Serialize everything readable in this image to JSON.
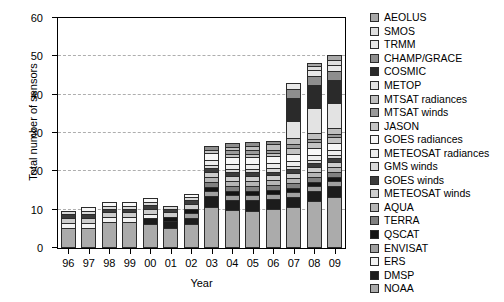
{
  "chart_data": {
    "type": "bar",
    "stacked": true,
    "title": "",
    "xlabel": "Year",
    "ylabel": "Total number of sensors",
    "ylim": [
      0,
      60
    ],
    "yticks": [
      0,
      10,
      20,
      30,
      40,
      50,
      60
    ],
    "grid": true,
    "legend_position": "right",
    "categories": [
      "96",
      "97",
      "98",
      "99",
      "00",
      "01",
      "02",
      "03",
      "04",
      "05",
      "06",
      "07",
      "08",
      "09"
    ],
    "totals": [
      11.5,
      12.3,
      13.3,
      13.2,
      12.9,
      12.0,
      15.3,
      28.0,
      28.0,
      28.3,
      29.0,
      47.0,
      52.2,
      53.0
    ],
    "series": [
      {
        "name": "NOAA",
        "color": "#ababab",
        "values": [
          5.2,
          5.2,
          6.6,
          6.6,
          6.3,
          5.3,
          6.2,
          10.7,
          9.8,
          9.7,
          10.0,
          10.6,
          12.1,
          13.3
        ]
      },
      {
        "name": "DMSP",
        "color": "#1c1c1c",
        "values": [
          0.0,
          0.0,
          0.0,
          0.0,
          1.4,
          1.6,
          1.6,
          2.7,
          2.6,
          2.7,
          2.6,
          2.7,
          2.6,
          2.7
        ]
      },
      {
        "name": "ERS",
        "color": "#f2f2f2",
        "values": [
          1.3,
          1.3,
          1.3,
          1.3,
          1.2,
          0.0,
          0.0,
          0.0,
          0.0,
          0.0,
          0.0,
          0.0,
          0.0,
          0.0
        ]
      },
      {
        "name": "ENVISAT",
        "color": "#a0a0a0",
        "values": [
          0.0,
          0.0,
          0.0,
          0.0,
          0.0,
          0.0,
          1.3,
          1.3,
          1.3,
          1.3,
          1.3,
          1.3,
          1.3,
          1.3
        ]
      },
      {
        "name": "QSCAT",
        "color": "#141414",
        "values": [
          0.0,
          0.0,
          0.0,
          0.0,
          0.0,
          1.0,
          1.0,
          1.0,
          1.0,
          1.0,
          1.0,
          1.0,
          1.0,
          1.0
        ]
      },
      {
        "name": "TERRA",
        "color": "#808080",
        "values": [
          0.0,
          0.0,
          0.0,
          0.0,
          0.0,
          0.0,
          0.0,
          1.3,
          1.3,
          1.3,
          1.3,
          1.3,
          1.3,
          1.3
        ]
      },
      {
        "name": "AQUA",
        "color": "#b5b5b5",
        "values": [
          0.0,
          0.0,
          0.0,
          0.0,
          0.0,
          0.0,
          0.0,
          1.3,
          1.3,
          1.3,
          1.3,
          1.3,
          1.3,
          1.3
        ]
      },
      {
        "name": "METEOSAT winds",
        "color": "#cdcdcd",
        "values": [
          1.3,
          1.3,
          1.3,
          1.3,
          1.3,
          1.3,
          1.3,
          1.3,
          1.3,
          1.3,
          1.3,
          1.3,
          1.3,
          1.3
        ]
      },
      {
        "name": "GOES winds",
        "color": "#3c3c3c",
        "values": [
          1.0,
          1.0,
          1.0,
          1.0,
          1.0,
          1.0,
          1.0,
          1.0,
          1.0,
          1.0,
          1.0,
          1.0,
          1.0,
          1.0
        ]
      },
      {
        "name": "GMS winds",
        "color": "#d9d9d9",
        "values": [
          0.8,
          0.8,
          0.8,
          0.8,
          0.8,
          0.8,
          0.8,
          0.8,
          0.8,
          0.8,
          0.8,
          0.8,
          0.8,
          0.8
        ]
      },
      {
        "name": "METEOSAT radiances",
        "color": "#ededed",
        "values": [
          0.0,
          0.0,
          0.0,
          0.0,
          0.0,
          0.0,
          0.0,
          1.3,
          1.3,
          1.3,
          1.3,
          1.3,
          1.3,
          1.3
        ]
      },
      {
        "name": "GOES radiances",
        "color": "#f7f7f7",
        "values": [
          0.0,
          0.9,
          0.9,
          0.9,
          0.9,
          0.0,
          0.9,
          1.8,
          1.8,
          1.8,
          1.8,
          1.8,
          1.8,
          1.8
        ]
      },
      {
        "name": "JASON",
        "color": "#c4c4c4",
        "values": [
          0.0,
          0.0,
          0.0,
          0.0,
          0.0,
          0.0,
          0.0,
          0.9,
          0.9,
          0.9,
          0.9,
          1.6,
          1.6,
          1.6
        ]
      },
      {
        "name": "MTSAT winds",
        "color": "#9a9a9a",
        "values": [
          0.0,
          0.0,
          0.0,
          0.0,
          0.0,
          0.0,
          0.0,
          0.0,
          0.9,
          0.9,
          0.9,
          0.9,
          0.9,
          0.9
        ]
      },
      {
        "name": "MTSAT radiances",
        "color": "#bfbfbf",
        "values": [
          0.0,
          0.0,
          0.0,
          0.0,
          0.0,
          0.0,
          0.0,
          0.0,
          0.9,
          1.2,
          1.4,
          1.6,
          1.6,
          1.6
        ]
      },
      {
        "name": "METOP",
        "color": "#e3e3e3",
        "values": [
          0.0,
          0.0,
          0.0,
          0.0,
          0.0,
          0.0,
          0.0,
          0.0,
          0.0,
          0.0,
          0.0,
          4.3,
          6.3,
          6.3
        ]
      },
      {
        "name": "COSMIC",
        "color": "#2a2a2a",
        "values": [
          0.0,
          0.0,
          0.0,
          0.0,
          0.0,
          0.0,
          0.0,
          0.0,
          0.0,
          0.0,
          0.0,
          6.0,
          6.0,
          6.0
        ]
      },
      {
        "name": "CHAMP/GRACE",
        "color": "#8e8e8e",
        "values": [
          0.0,
          0.0,
          0.0,
          0.0,
          0.0,
          0.0,
          0.0,
          0.9,
          0.9,
          0.9,
          0.9,
          2.4,
          2.4,
          2.4
        ]
      },
      {
        "name": "TRMM",
        "color": "#e8e8e8",
        "values": [
          0.0,
          0.0,
          0.0,
          0.0,
          0.0,
          0.0,
          0.0,
          0.0,
          0.0,
          0.0,
          0.0,
          1.6,
          1.6,
          1.6
        ]
      },
      {
        "name": "SMOS",
        "color": "#dedede",
        "values": [
          0.0,
          0.0,
          0.0,
          0.0,
          0.0,
          0.0,
          0.0,
          0.0,
          0.0,
          0.0,
          0.0,
          0.0,
          0.9,
          1.2
        ]
      },
      {
        "name": "AEOLUS",
        "color": "#a8a8a8",
        "values": [
          0.0,
          0.0,
          0.0,
          0.0,
          0.0,
          0.0,
          0.0,
          0.0,
          0.0,
          0.0,
          0.0,
          0.0,
          0.9,
          1.2
        ]
      }
    ],
    "legend_order": [
      {
        "label": "AEOLUS",
        "color": "#a8a8a8"
      },
      {
        "label": "SMOS",
        "color": "#dedede"
      },
      {
        "label": "TRMM",
        "color": "#e8e8e8"
      },
      {
        "label": "CHAMP/GRACE",
        "color": "#8e8e8e"
      },
      {
        "label": "COSMIC",
        "color": "#2a2a2a"
      },
      {
        "label": "METOP",
        "color": "#e3e3e3"
      },
      {
        "label": "MTSAT radiances",
        "color": "#bfbfbf"
      },
      {
        "label": "MTSAT winds",
        "color": "#9a9a9a"
      },
      {
        "label": "JASON",
        "color": "#c4c4c4"
      },
      {
        "label": "GOES radiances",
        "color": "#f7f7f7"
      },
      {
        "label": "METEOSAT radiances",
        "color": "#ededed"
      },
      {
        "label": "GMS winds",
        "color": "#d9d9d9"
      },
      {
        "label": "GOES winds",
        "color": "#3c3c3c"
      },
      {
        "label": "METEOSAT winds",
        "color": "#cdcdcd"
      },
      {
        "label": "AQUA",
        "color": "#b5b5b5"
      },
      {
        "label": "TERRA",
        "color": "#808080"
      },
      {
        "label": "QSCAT",
        "color": "#141414"
      },
      {
        "label": "ENVISAT",
        "color": "#a0a0a0"
      },
      {
        "label": "ERS",
        "color": "#f2f2f2"
      },
      {
        "label": "DMSP",
        "color": "#1c1c1c"
      },
      {
        "label": "NOAA",
        "color": "#ababab"
      }
    ]
  }
}
